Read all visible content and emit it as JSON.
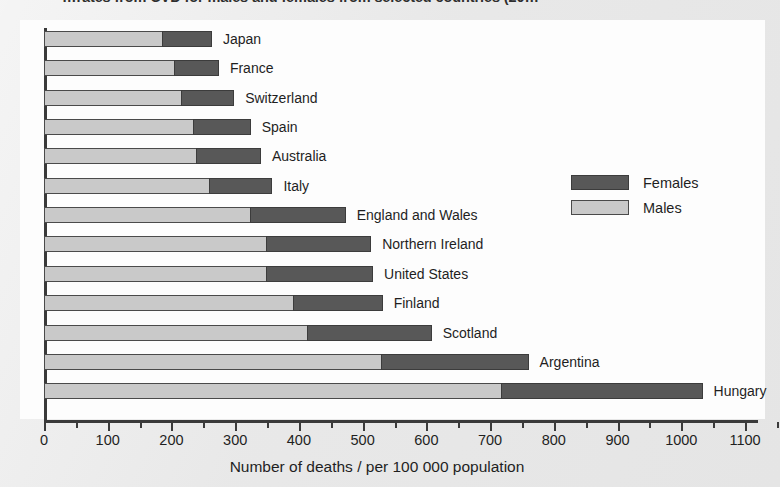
{
  "title_fragment": "…rates from CVD for males and females from selected countries (20…",
  "legend": {
    "position": "inside-right",
    "entries": [
      {
        "label": "Females",
        "color": "#585858"
      },
      {
        "label": "Males",
        "color": "#c9c9c9"
      }
    ]
  },
  "axis": {
    "x_title": "Number of deaths / per 100 000 population",
    "tick_labels": [
      "0",
      "100",
      "200",
      "300",
      "400",
      "500",
      "600",
      "700",
      "800",
      "900",
      "1000",
      "1100"
    ]
  },
  "chart_data": {
    "type": "bar",
    "orientation": "horizontal",
    "stacked": true,
    "title": "…rates from CVD for males and females from selected countries (20…",
    "xlabel": "Number of deaths / per 100 000 population",
    "ylabel": "",
    "xlim": [
      0,
      1100
    ],
    "xticks": [
      0,
      100,
      200,
      300,
      400,
      500,
      600,
      700,
      800,
      900,
      1000,
      1100
    ],
    "minor_tick_step": 50,
    "grid": false,
    "legend_entries": [
      "Females",
      "Males"
    ],
    "categories": [
      "Japan",
      "France",
      "Switzerland",
      "Spain",
      "Australia",
      "Italy",
      "England and Wales",
      "Northern Ireland",
      "United States",
      "Finland",
      "Scotland",
      "Argentina",
      "Hungary"
    ],
    "series": [
      {
        "name": "Males",
        "color": "#c9c9c9",
        "values": [
          187,
          205,
          217,
          235,
          240,
          260,
          325,
          350,
          350,
          392,
          415,
          530,
          718
        ]
      },
      {
        "name": "Females",
        "color": "#585858",
        "values": [
          78,
          71,
          83,
          91,
          102,
          100,
          150,
          165,
          168,
          141,
          195,
          232,
          317
        ]
      }
    ],
    "totals": [
      265,
      276,
      300,
      326,
      342,
      360,
      475,
      515,
      518,
      533,
      610,
      762,
      1035
    ]
  }
}
